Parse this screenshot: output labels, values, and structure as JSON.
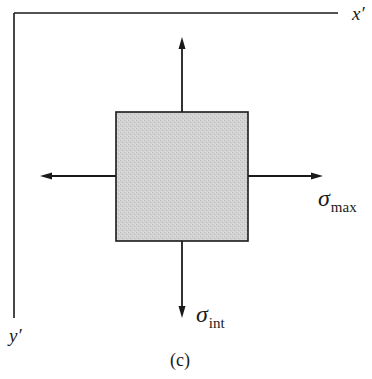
{
  "figure": {
    "caption": "(c)",
    "axes": {
      "x_axis": {
        "label": "x′"
      },
      "y_axis": {
        "label": "y′"
      }
    },
    "element": {
      "shape": "square",
      "fill_color": "#cfcfcf",
      "stroke_color": "#1a1a1a"
    },
    "stresses": {
      "horizontal": {
        "symbol": "σ",
        "subscript": "max",
        "direction": "both-left-and-right"
      },
      "vertical": {
        "symbol": "σ",
        "subscript": "int",
        "direction": "both-up-and-down"
      }
    },
    "colors": {
      "line": "#1a1a1a",
      "background": "#ffffff"
    }
  }
}
